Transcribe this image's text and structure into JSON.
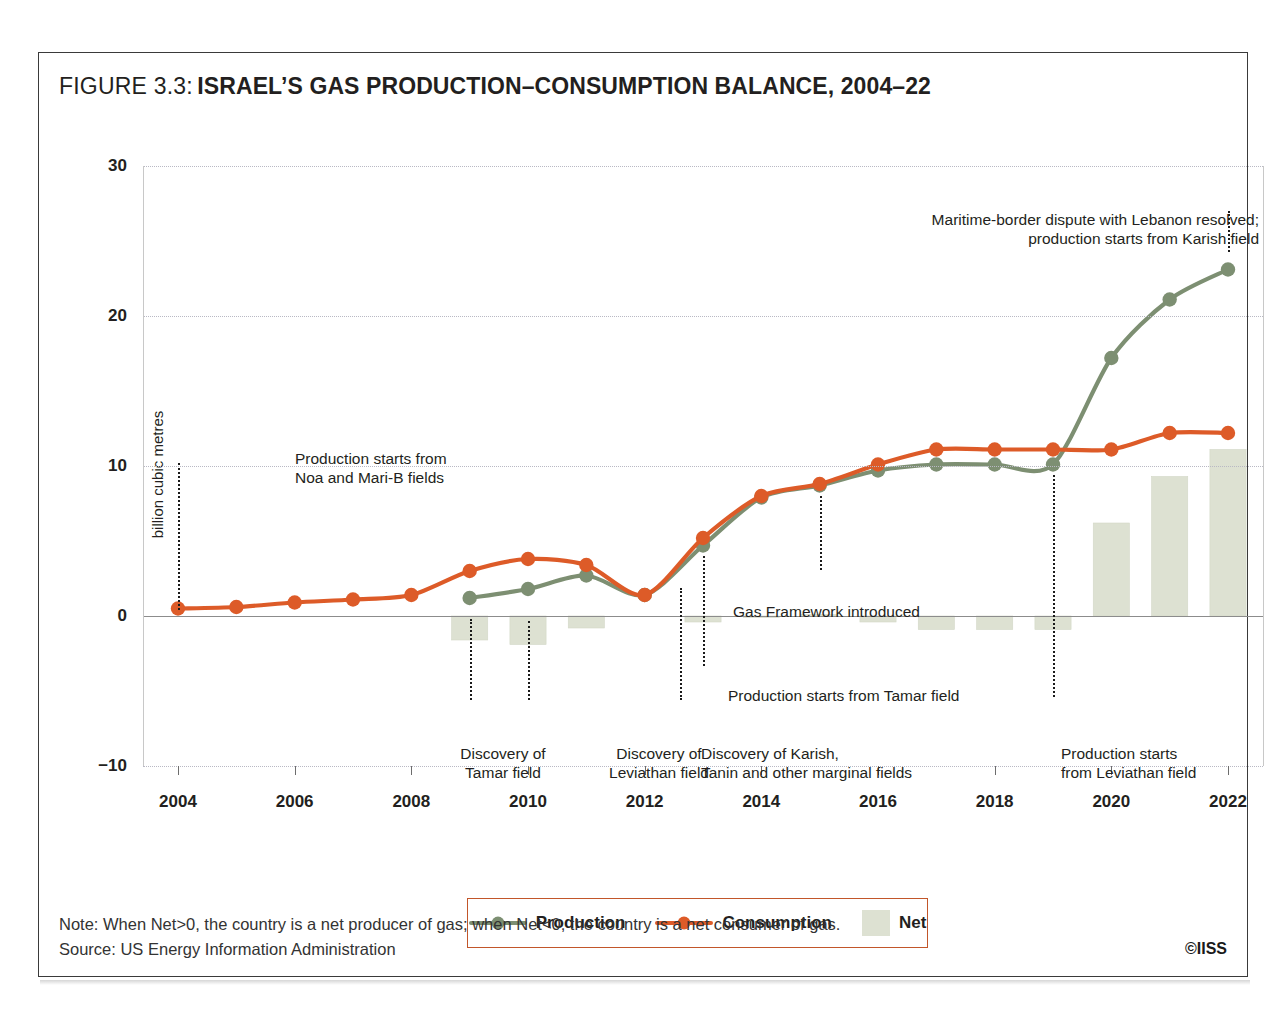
{
  "figure": {
    "label": "FIGURE 3.3:",
    "title": "ISRAEL’S GAS PRODUCTION–CONSUMPTION BALANCE, 2004–22"
  },
  "notes": {
    "note": "Note: When Net>0, the country is a net producer of gas; when Net<0, the country is a net consumer of gas.",
    "source": "Source: US Energy Information Administration",
    "credit": "©IISS"
  },
  "legend": {
    "position": "bottom-center",
    "items": [
      {
        "label": "Production",
        "type": "line-marker",
        "color": "#7d8f72"
      },
      {
        "label": "Consumption",
        "type": "line-marker",
        "color": "#dd5b28"
      },
      {
        "label": "Net",
        "type": "swatch",
        "color": "#dde1d2"
      }
    ]
  },
  "colors": {
    "production": "#7d8f72",
    "consumption": "#dd5b28",
    "net": "#dde1d2",
    "net_border": "#d3d8c7",
    "grid": "#b9b9c4",
    "axis": "#8c8c8c",
    "text": "#231f20",
    "legend_border": "#c2562a"
  },
  "chart_data": {
    "type": "line",
    "title": "ISRAEL’S GAS PRODUCTION–CONSUMPTION BALANCE, 2004–22",
    "xlabel": "",
    "ylabel": "billion cubic metres",
    "ylim": [
      -10,
      30
    ],
    "yticks": [
      30,
      20,
      10,
      0,
      -10
    ],
    "xlim": [
      2003.4,
      2022.6
    ],
    "xticks": [
      2004,
      2006,
      2008,
      2010,
      2012,
      2014,
      2016,
      2018,
      2020,
      2022
    ],
    "grid": true,
    "x": [
      2004,
      2005,
      2006,
      2007,
      2008,
      2009,
      2010,
      2011,
      2012,
      2013,
      2014,
      2015,
      2016,
      2017,
      2018,
      2019,
      2020,
      2021,
      2022
    ],
    "series": [
      {
        "name": "Production",
        "type": "line",
        "color": "#7d8f72",
        "values": [
          null,
          null,
          null,
          null,
          null,
          1.2,
          1.8,
          2.7,
          1.4,
          4.7,
          7.9,
          8.7,
          9.7,
          10.1,
          10.1,
          10.1,
          17.2,
          21.1,
          23.1
        ]
      },
      {
        "name": "Consumption",
        "type": "line",
        "color": "#dd5b28",
        "values": [
          0.5,
          0.6,
          0.9,
          1.1,
          1.4,
          3.0,
          3.8,
          3.4,
          1.4,
          5.2,
          8.0,
          8.8,
          10.1,
          11.1,
          11.1,
          11.1,
          11.1,
          12.2,
          12.2
        ]
      },
      {
        "name": "Net",
        "type": "bar",
        "color": "#dde1d2",
        "values": [
          0,
          0,
          0,
          0,
          0,
          -1.6,
          -1.9,
          -0.8,
          0,
          -0.4,
          -0.1,
          0.1,
          -0.4,
          -0.9,
          -0.9,
          -0.9,
          6.2,
          9.3,
          11.1
        ]
      }
    ],
    "annotations": [
      {
        "id": "noa-mari-b",
        "lines": [
          "Production starts from",
          "Noa and Mari-B fields"
        ],
        "align": "left",
        "x_year": 2004,
        "leader_from": 10.2,
        "leader_to": 0.4
      },
      {
        "id": "tamar-discovery",
        "lines": [
          "Discovery of",
          "Tamar field"
        ],
        "align": "center",
        "x_year": 2009,
        "leader_from": -0.2,
        "leader_to": -5.6
      },
      {
        "id": "leviathan-discovery",
        "lines": [
          "Discovery of",
          "Leviathan field"
        ],
        "align": "center",
        "x_year": 2010,
        "leader_from": -0.3,
        "leader_to": -5.6
      },
      {
        "id": "karish-tanin-discovery",
        "lines": [
          "Discovery of Karish,",
          "Tanin and other marginal fields"
        ],
        "align": "left",
        "x_year": 2012.6,
        "leader_from": 1.9,
        "leader_to": -5.6
      },
      {
        "id": "tamar-production",
        "lines": [
          "Production starts from Tamar field"
        ],
        "align": "left",
        "x_year": 2013,
        "leader_from": 4.0,
        "leader_to": -3.3
      },
      {
        "id": "gas-framework",
        "lines": [
          "Gas Framework introduced"
        ],
        "align": "left",
        "x_year": 2015,
        "leader_from": 8.0,
        "leader_to": 3.1
      },
      {
        "id": "leviathan-production",
        "lines": [
          "Production starts",
          "from Leviathan field"
        ],
        "align": "left",
        "x_year": 2019,
        "leader_from": 9.4,
        "leader_to": -5.4
      },
      {
        "id": "karish-production",
        "lines": [
          "Maritime-border dispute with Lebanon resolved;",
          "production starts from Karish field"
        ],
        "align": "right",
        "x_year": 2022,
        "leader_from": 27.0,
        "leader_to": 24.3
      }
    ]
  }
}
